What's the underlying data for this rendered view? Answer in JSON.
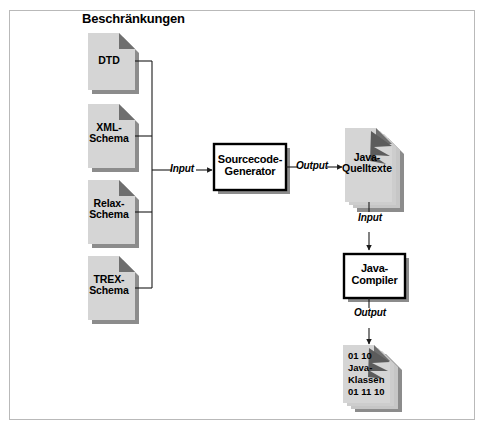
{
  "diagram": {
    "type": "flowchart",
    "language": "de",
    "heading": "Beschränkungen",
    "colors": {
      "document_fill": "#d5d5d5",
      "document_fold": "#777777",
      "document_shadow": "#8c8c8c",
      "box_fill": "#ffffff",
      "box_border": "#000000",
      "line": "#1a1a1a",
      "frame_border": "#b9b9b9",
      "page_background": "#ffffff",
      "text": "#000000"
    },
    "inputs": [
      {
        "id": "dtd",
        "label": "DTD",
        "shape": "document"
      },
      {
        "id": "xml-schema",
        "label": "XML-\nSchema",
        "shape": "document"
      },
      {
        "id": "relax-schema",
        "label": "Relax-\nSchema",
        "shape": "document"
      },
      {
        "id": "trex-schema",
        "label": "TREX-\nSchema",
        "shape": "document"
      }
    ],
    "processes": [
      {
        "id": "sourcecode-generator",
        "label": "Sourcecode-\nGenerator",
        "shape": "process-box"
      },
      {
        "id": "java-compiler",
        "label": "Java-\nCompiler",
        "shape": "process-box"
      }
    ],
    "artifacts": [
      {
        "id": "java-quelltexte",
        "label": "Java-\nQuelltexte",
        "shape": "document-stack"
      },
      {
        "id": "java-klassen",
        "label": "01 10\nJava-\nKlassen\n01 11 10",
        "shape": "document-stack"
      }
    ],
    "edges": [
      {
        "id": "edge-input-generator",
        "label": "Input",
        "from": "constraints-bus",
        "to": "sourcecode-generator"
      },
      {
        "id": "edge-output-quelltexte",
        "label": "Output",
        "from": "sourcecode-generator",
        "to": "java-quelltexte"
      },
      {
        "id": "edge-input-compiler",
        "label": "Input",
        "from": "java-quelltexte",
        "to": "java-compiler"
      },
      {
        "id": "edge-output-klassen",
        "label": "Output",
        "from": "java-compiler",
        "to": "java-klassen"
      }
    ]
  }
}
